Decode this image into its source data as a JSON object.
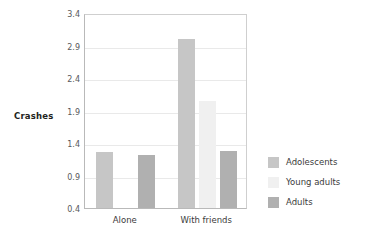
{
  "chart_data": {
    "type": "bar",
    "title": "",
    "subtitle": "",
    "xlabel": "",
    "ylabel": "Crashes",
    "categories": [
      "Alone",
      "With friends"
    ],
    "series": [
      {
        "name": "Adolescents",
        "color": "#c6c6c6",
        "values": [
          1.26,
          3.0
        ]
      },
      {
        "name": "Young adults",
        "color": "#f0f0f0",
        "values": [
          0.4,
          2.05
        ]
      },
      {
        "name": "Adults",
        "color": "#b0b0b0",
        "values": [
          1.22,
          1.27
        ]
      }
    ],
    "ylim": [
      0.4,
      3.4
    ],
    "yticks": [
      "0.4",
      "0.9",
      "1.4",
      "1.9",
      "2.4",
      "2.9",
      "3.4"
    ],
    "ytick_values": [
      0.4,
      0.9,
      1.4,
      1.9,
      2.4,
      2.9,
      3.4
    ],
    "grid": true,
    "grid_axis": "y",
    "legend_position": "right",
    "background_color": "#ffffff",
    "grid_color": "#e9e9e9",
    "axis_color": "#b9b9b9",
    "tick_label_color": "#58595b"
  }
}
